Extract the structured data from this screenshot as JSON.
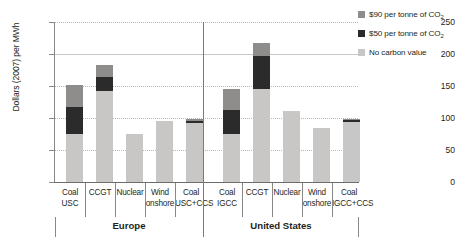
{
  "chart_data": {
    "type": "bar",
    "subtype": "stacked-grouped",
    "title": "",
    "xlabel": "",
    "ylabel": "Dollars (2007) per MWh",
    "ylim": [
      0,
      250
    ],
    "yticks": [
      0,
      50,
      100,
      150,
      200,
      250
    ],
    "grid": true,
    "legend_position": "right",
    "groups": [
      "Europe",
      "United States"
    ],
    "categories": [
      {
        "group": "Europe",
        "line1": "Coal",
        "line2": "USC"
      },
      {
        "group": "Europe",
        "line1": "CCGT",
        "line2": ""
      },
      {
        "group": "Europe",
        "line1": "Nuclear",
        "line2": ""
      },
      {
        "group": "Europe",
        "line1": "Wind",
        "line2": "onshore"
      },
      {
        "group": "Europe",
        "line1": "Coal",
        "line2": "USC+CCS"
      },
      {
        "group": "United States",
        "line1": "Coal",
        "line2": "IGCC"
      },
      {
        "group": "United States",
        "line1": "CCGT",
        "line2": ""
      },
      {
        "group": "United States",
        "line1": "Nuclear",
        "line2": ""
      },
      {
        "group": "United States",
        "line1": "Wind",
        "line2": "onshore"
      },
      {
        "group": "United States",
        "line1": "Coal",
        "line2": "IGCC+CCS"
      }
    ],
    "series": [
      {
        "name": "No carbon value",
        "color": "#c9c7c5",
        "values": [
          75,
          142,
          75,
          96,
          92,
          75,
          145,
          111,
          84,
          93
        ]
      },
      {
        "name": "$50 per tonne of CO2",
        "color": "#2b2b2b",
        "values": [
          42,
          22,
          0,
          0,
          3,
          38,
          52,
          0,
          0,
          4
        ]
      },
      {
        "name": "$90 per tonne of CO2",
        "color": "#8f8d8b",
        "values": [
          35,
          19,
          0,
          0,
          3,
          32,
          20,
          0,
          0,
          2
        ]
      }
    ],
    "totals": [
      152,
      183,
      75,
      96,
      98,
      145,
      217,
      111,
      84,
      99
    ]
  },
  "legend": {
    "entries": [
      {
        "label_main": "$90 per tonne of CO",
        "label_sub": "2",
        "color": "#8f8d8b"
      },
      {
        "label_main": "$50 per tonne of CO",
        "label_sub": "2",
        "color": "#2b2b2b"
      },
      {
        "label_main": "No carbon value",
        "label_sub": "",
        "color": "#c9c7c5"
      }
    ]
  },
  "axis": {
    "y_title": "Dollars (2007) per MWh",
    "tick_250": "250",
    "tick_200": "200",
    "tick_150": "150",
    "tick_100": "100",
    "tick_50": "50",
    "tick_0": "0"
  },
  "groups": {
    "europe": "Europe",
    "united_states": "United States"
  },
  "cats": {
    "c0_l1": "Coal",
    "c0_l2": "USC",
    "c1_l1": "CCGT",
    "c1_l2": "",
    "c2_l1": "Nuclear",
    "c2_l2": "",
    "c3_l1": "Wind",
    "c3_l2": "onshore",
    "c4_l1": "Coal",
    "c4_l2": "USC+CCS",
    "c5_l1": "Coal",
    "c5_l2": "IGCC",
    "c6_l1": "CCGT",
    "c6_l2": "",
    "c7_l1": "Nuclear",
    "c7_l2": "",
    "c8_l1": "Wind",
    "c8_l2": "onshore",
    "c9_l1": "Coal",
    "c9_l2": "IGCC+CCS"
  }
}
